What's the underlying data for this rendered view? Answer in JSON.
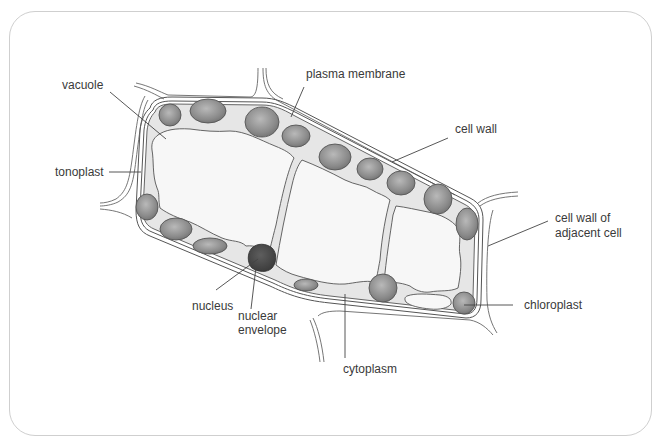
{
  "figure": {
    "type": "labeled diagram",
    "labels": {
      "vacuole": "vacuole",
      "tonoplast": "tonoplast",
      "plasma_membrane": "plasma membrane",
      "cell_wall": "cell wall",
      "cell_wall_adjacent_line1": "cell wall of",
      "cell_wall_adjacent_line2": "adjacent cell",
      "chloroplast": "chloroplast",
      "nucleus": "nucleus",
      "nuclear_envelope_line1": "nuclear",
      "nuclear_envelope_line2": "envelope",
      "cytoplasm": "cytoplasm"
    },
    "colors": {
      "background": "#ffffff",
      "card_border": "#cfcfcf",
      "cytoplasm_fill": "#e6e6e6",
      "vacuole_fill": "#f6f6f6",
      "chloroplast_fill": "#8f8f8f",
      "nucleus_fill": "#4a4a4a",
      "outline": "#555555",
      "label_text": "#3a3a3a"
    }
  }
}
